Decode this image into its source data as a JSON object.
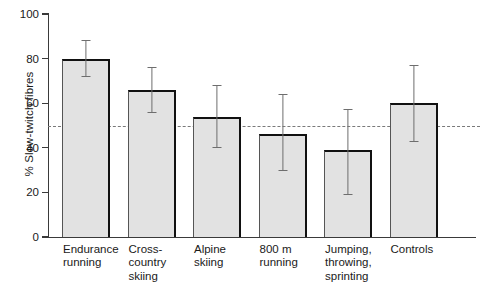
{
  "chart_data": {
    "type": "bar",
    "title": "",
    "xlabel": "",
    "ylabel": "% Slow-twitch fibres",
    "ylim": [
      0,
      100
    ],
    "yticks": [
      0,
      20,
      40,
      60,
      80,
      100
    ],
    "grid": false,
    "legend": "none",
    "error_type": "error bars (vertical line with caps)",
    "categories": [
      "Endurance\nrunning",
      "Cross-\ncountry\nskiing",
      "Alpine\nskiing",
      "800 m\nrunning",
      "Jumping,\nthrowing,\nsprinting",
      "Controls"
    ],
    "categories_flat": [
      "Endurance running",
      "Cross-country skiing",
      "Alpine skiing",
      "800 m running",
      "Jumping, throwing, sprinting",
      "Controls"
    ],
    "values": [
      80,
      66,
      54,
      46,
      39,
      60
    ],
    "error_low": [
      72,
      56,
      40,
      30,
      19,
      43
    ],
    "error_high": [
      88,
      76,
      68,
      64,
      57,
      77
    ],
    "annotations": [
      {
        "name": "reference-line",
        "type": "hline",
        "value": 50,
        "style": "dashed",
        "color": "#7a7a7a"
      }
    ],
    "colors": {
      "bar_fill": "#e2e2e2",
      "bar_edge": "#111111",
      "error_bar": "#6e6e6e",
      "axis": "#3a3a3a",
      "reference_line": "#7a7a7a",
      "background": "#ffffff",
      "text": "#1a1a1a"
    }
  }
}
